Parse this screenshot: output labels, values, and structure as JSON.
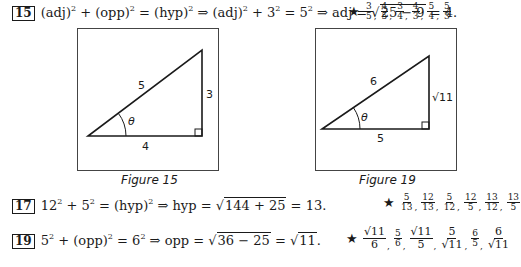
{
  "problems": {
    "p15": {
      "number": "15",
      "part1": "(adj)",
      "exp1": "2",
      "part2": " + (opp)",
      "exp2": "2",
      "part3": " = (hyp)",
      "exp3": "2",
      "part4": " ⇒ (adj)",
      "exp4": "2",
      "part5": " + 3",
      "exp5": "2",
      "part6": " = 5",
      "exp6": "2",
      "part7": " ⇒ adj = ",
      "radicand": "25 − 9",
      "result": " = 4.",
      "answers": [
        {
          "n": "3",
          "d": "5"
        },
        {
          "n": "4",
          "d": "5"
        },
        {
          "n": "3",
          "d": "4"
        },
        {
          "n": "4",
          "d": "3"
        },
        {
          "n": "5",
          "d": "4"
        },
        {
          "n": "5",
          "d": "3"
        }
      ]
    },
    "p17": {
      "number": "17",
      "part1": "12",
      "exp1": "2",
      "part2": " + 5",
      "exp2": "2",
      "part3": " = (hyp)",
      "exp3": "2",
      "part4": " ⇒ hyp = ",
      "radicand": "144 + 25",
      "result": " = 13.",
      "answers": [
        {
          "n": "5",
          "d": "13"
        },
        {
          "n": "12",
          "d": "13"
        },
        {
          "n": "5",
          "d": "12"
        },
        {
          "n": "12",
          "d": "5"
        },
        {
          "n": "13",
          "d": "12"
        },
        {
          "n": "13",
          "d": "5"
        }
      ]
    },
    "p19": {
      "number": "19",
      "part1": "5",
      "exp1": "2",
      "part2": " + (opp)",
      "exp2": "2",
      "part3": " = 6",
      "exp3": "2",
      "part4": " ⇒ opp = ",
      "radicand": "36 − 25",
      "part5": " = ",
      "radicand2": "11",
      "result": ".",
      "answers": [
        {
          "n": "√11",
          "d": "6"
        },
        {
          "n": "5",
          "d": "6"
        },
        {
          "n": "√11",
          "d": "5"
        },
        {
          "n": "5",
          "d": "√11"
        },
        {
          "n": "6",
          "d": "5"
        },
        {
          "n": "6",
          "d": "√11"
        }
      ]
    }
  },
  "star": "★",
  "sqrt_symbol": "√",
  "figures": [
    {
      "caption": "Figure 15",
      "hyp": "5",
      "opp": "3",
      "adj": "4",
      "angle": "θ"
    },
    {
      "caption": "Figure 19",
      "hyp": "6",
      "opp": "√11",
      "adj": "5",
      "angle": "θ"
    }
  ]
}
